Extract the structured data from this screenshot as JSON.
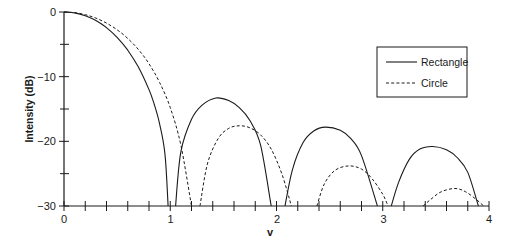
{
  "chart_data": {
    "type": "line",
    "title": "",
    "xlabel": "v",
    "ylabel": "Intensity (dB)",
    "xlim": [
      0,
      4
    ],
    "ylim": [
      -30,
      0
    ],
    "x_ticks": [
      "0",
      "1",
      "2",
      "3",
      "4"
    ],
    "y_ticks": [
      "0",
      "−10",
      "−20",
      "−30"
    ],
    "grid": false,
    "legend_position": "upper right",
    "series": [
      {
        "name": "Rectangle",
        "style": "solid",
        "points": [
          [
            0,
            0
          ],
          [
            0.1,
            -0.14
          ],
          [
            0.2,
            -0.57
          ],
          [
            0.3,
            -1.32
          ],
          [
            0.4,
            -2.42
          ],
          [
            0.5,
            -3.92
          ],
          [
            0.6,
            -5.91
          ],
          [
            0.7,
            -8.52
          ],
          [
            0.8,
            -12.0
          ],
          [
            0.85,
            -14.3
          ],
          [
            0.9,
            -17.3
          ],
          [
            0.95,
            -21.9
          ],
          [
            0.98,
            -30
          ],
          [
            1.05,
            -30
          ],
          [
            1.1,
            -21.6
          ],
          [
            1.2,
            -16.6
          ],
          [
            1.3,
            -14.4
          ],
          [
            1.43,
            -13.3
          ],
          [
            1.55,
            -13.7
          ],
          [
            1.65,
            -14.8
          ],
          [
            1.75,
            -16.8
          ],
          [
            1.85,
            -20.6
          ],
          [
            1.95,
            -30
          ],
          [
            2.08,
            -30
          ],
          [
            2.15,
            -24.4
          ],
          [
            2.25,
            -20.2
          ],
          [
            2.35,
            -18.4
          ],
          [
            2.46,
            -17.8
          ],
          [
            2.6,
            -18.3
          ],
          [
            2.7,
            -19.6
          ],
          [
            2.8,
            -22.2
          ],
          [
            2.95,
            -30
          ],
          [
            3.08,
            -30
          ],
          [
            3.15,
            -26.3
          ],
          [
            3.25,
            -22.8
          ],
          [
            3.35,
            -21.2
          ],
          [
            3.47,
            -20.8
          ],
          [
            3.6,
            -21.3
          ],
          [
            3.7,
            -22.5
          ],
          [
            3.8,
            -24.8
          ],
          [
            3.9,
            -30
          ]
        ]
      },
      {
        "name": "Circle",
        "style": "dashed",
        "points": [
          [
            0,
            0
          ],
          [
            0.1,
            -0.1
          ],
          [
            0.2,
            -0.42
          ],
          [
            0.3,
            -0.95
          ],
          [
            0.4,
            -1.72
          ],
          [
            0.5,
            -2.75
          ],
          [
            0.6,
            -4.1
          ],
          [
            0.7,
            -5.8
          ],
          [
            0.8,
            -8.0
          ],
          [
            0.9,
            -10.9
          ],
          [
            1.0,
            -14.8
          ],
          [
            1.1,
            -20.6
          ],
          [
            1.2,
            -30
          ],
          [
            1.28,
            -30
          ],
          [
            1.35,
            -23.5
          ],
          [
            1.45,
            -19.6
          ],
          [
            1.55,
            -18.0
          ],
          [
            1.65,
            -17.6
          ],
          [
            1.75,
            -17.9
          ],
          [
            1.85,
            -19.0
          ],
          [
            1.95,
            -21.2
          ],
          [
            2.05,
            -25.0
          ],
          [
            2.14,
            -30
          ],
          [
            2.38,
            -30
          ],
          [
            2.45,
            -26.6
          ],
          [
            2.55,
            -24.5
          ],
          [
            2.68,
            -23.8
          ],
          [
            2.8,
            -24.3
          ],
          [
            2.9,
            -25.8
          ],
          [
            3.0,
            -28.2
          ],
          [
            3.05,
            -30
          ],
          [
            3.38,
            -30
          ],
          [
            3.45,
            -29.0
          ],
          [
            3.55,
            -27.8
          ],
          [
            3.68,
            -27.3
          ],
          [
            3.78,
            -27.8
          ],
          [
            3.88,
            -29.0
          ],
          [
            3.95,
            -30
          ]
        ]
      }
    ]
  },
  "legend": {
    "items": [
      {
        "label": "Rectangle",
        "style": "solid"
      },
      {
        "label": "Circle",
        "style": "dashed"
      }
    ]
  },
  "axes": {
    "xlabel": "v",
    "ylabel": "Intensity (dB)",
    "x_tick_labels": [
      "0",
      "1",
      "2",
      "3",
      "4"
    ],
    "y_tick_labels": [
      "0",
      "−10",
      "−20",
      "−30"
    ]
  },
  "colors": {
    "line": "#1a1a1a",
    "axis": "#1a1a1a",
    "background": "#ffffff"
  }
}
